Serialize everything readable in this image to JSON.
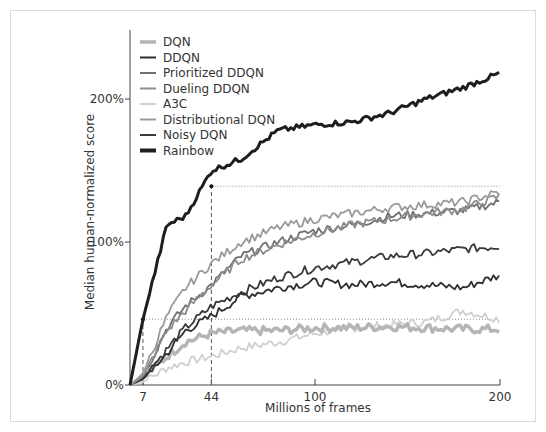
{
  "chart_data": {
    "type": "line",
    "title": "",
    "xlabel": "Millions of frames",
    "ylabel": "Median human-normalized score",
    "xlim": [
      0,
      200
    ],
    "ylim": [
      0,
      250
    ],
    "x_ticks": [
      7,
      44,
      100,
      200
    ],
    "x_tick_labels": [
      "7",
      "44",
      "100",
      "200"
    ],
    "y_ticks": [
      0,
      100,
      200
    ],
    "y_tick_labels": [
      "0%",
      "100%",
      "200%"
    ],
    "grid": false,
    "legend_position": "upper left",
    "annotations": [
      {
        "type": "hline-dotted",
        "y": 46,
        "label": "DQN final level"
      },
      {
        "type": "hline-dotted",
        "y": 139,
        "label": "best baseline final level"
      },
      {
        "type": "vline-dashed",
        "x": 7,
        "label": "Rainbow matches DQN at 7M frames"
      },
      {
        "type": "vline-dashed",
        "x": 44,
        "label": "Rainbow matches best baseline at 44M frames"
      }
    ],
    "x": [
      0,
      7,
      20,
      30,
      44,
      60,
      80,
      100,
      120,
      140,
      160,
      180,
      200
    ],
    "series": [
      {
        "name": "DQN",
        "color": "#b5b5b5",
        "values": [
          0,
          5,
          20,
          30,
          36,
          38,
          38,
          40,
          40,
          41,
          40,
          39,
          39
        ]
      },
      {
        "name": "DDQN",
        "color": "#2e2e2e",
        "values": [
          0,
          4,
          22,
          38,
          48,
          62,
          68,
          72,
          70,
          72,
          70,
          68,
          77
        ]
      },
      {
        "name": "Prioritized DDQN",
        "color": "#707070",
        "values": [
          0,
          6,
          40,
          55,
          70,
          90,
          100,
          108,
          112,
          118,
          120,
          122,
          128
        ]
      },
      {
        "name": "Dueling DDQN",
        "color": "#8c8c8c",
        "values": [
          0,
          6,
          38,
          52,
          70,
          88,
          98,
          106,
          112,
          116,
          120,
          123,
          132
        ]
      },
      {
        "name": "A3C",
        "color": "#d0d0d0",
        "values": [
          0,
          2,
          12,
          16,
          20,
          26,
          30,
          36,
          40,
          42,
          44,
          52,
          46
        ]
      },
      {
        "name": "Distributional DQN",
        "color": "#9a9a9a",
        "values": [
          0,
          8,
          48,
          68,
          85,
          100,
          110,
          116,
          120,
          124,
          126,
          128,
          135
        ]
      },
      {
        "name": "Noisy DQN",
        "color": "#3a3a3a",
        "values": [
          0,
          5,
          25,
          40,
          55,
          65,
          75,
          82,
          86,
          90,
          92,
          95,
          97
        ]
      },
      {
        "name": "Rainbow",
        "color": "#1e1e1e",
        "values": [
          0,
          46,
          112,
          118,
          150,
          158,
          178,
          182,
          184,
          190,
          200,
          208,
          218
        ]
      }
    ]
  }
}
